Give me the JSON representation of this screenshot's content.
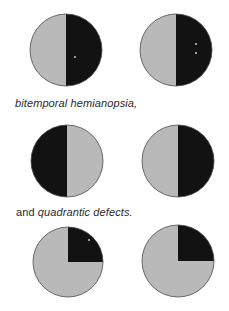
{
  "colors": {
    "seen": "#b9b9b9",
    "blind": "#121212",
    "outline": "#4a4a4a",
    "spot": "#9a9a9a",
    "background": "#ffffff",
    "text": "#2a2a2a"
  },
  "captions": {
    "hemianopsia": "bitemporal hemianopsia,",
    "quadrantic_prefix": "and ",
    "quadrantic_term": "quadrantic defects."
  },
  "fields": [
    {
      "name": "row1-left-field",
      "cx": 66,
      "cy": 50,
      "r": 36,
      "defect": "right-half",
      "spots": [
        [
          75,
          57
        ]
      ]
    },
    {
      "name": "row1-right-field",
      "cx": 176,
      "cy": 50,
      "r": 36,
      "defect": "right-half",
      "spots": [
        [
          196,
          44
        ],
        [
          196,
          53
        ]
      ]
    },
    {
      "name": "row2-left-field",
      "cx": 67,
      "cy": 161,
      "r": 36,
      "defect": "left-half",
      "spots": []
    },
    {
      "name": "row2-right-field",
      "cx": 178,
      "cy": 161,
      "r": 36,
      "defect": "right-half",
      "spots": []
    },
    {
      "name": "row3-left-field",
      "cx": 68,
      "cy": 262,
      "r": 35,
      "defect": "upper-right-quadrant",
      "spots": [
        [
          89,
          240
        ]
      ]
    },
    {
      "name": "row3-right-field",
      "cx": 178,
      "cy": 261,
      "r": 36,
      "defect": "upper-right-quadrant",
      "spots": []
    }
  ]
}
